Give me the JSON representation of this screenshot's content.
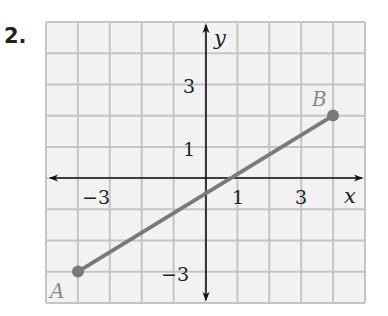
{
  "problem": {
    "number": "2."
  },
  "graph": {
    "x_axis_label": "x",
    "y_axis_label": "y",
    "x_range": [
      -5,
      5
    ],
    "y_range": [
      -4,
      5
    ],
    "x_tick_labels": [
      {
        "value": -3,
        "text": "−3"
      },
      {
        "value": 1,
        "text": "1"
      },
      {
        "value": 3,
        "text": "3"
      }
    ],
    "y_tick_labels": [
      {
        "value": 3,
        "text": "3"
      },
      {
        "value": 1,
        "text": "1"
      },
      {
        "value": -3,
        "text": "−3"
      }
    ],
    "segment": {
      "color": "#7a7a7a",
      "start": {
        "label": "A",
        "x": -4,
        "y": -3
      },
      "end": {
        "label": "B",
        "x": 4,
        "y": 2
      }
    },
    "grid_color": "#c4c4c4",
    "grid_background": "#f2f2f2"
  }
}
